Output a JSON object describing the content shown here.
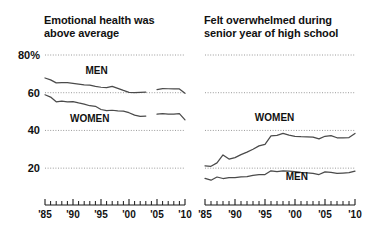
{
  "chart_data": [
    {
      "id": "emotional-health",
      "type": "line",
      "title": "Emotional health was\nabove average",
      "xlabel": "",
      "ylabel": "",
      "ylim": [
        10,
        80
      ],
      "xlim": [
        1985,
        2010
      ],
      "grid": true,
      "grid_values": [
        80,
        60,
        40,
        20
      ],
      "ytick_labels": [
        "80%",
        "60",
        "40",
        "20"
      ],
      "xticks": [
        1985,
        1990,
        1995,
        2000,
        2005,
        2010
      ],
      "xtick_labels": [
        "'85",
        "'90",
        "'95",
        "'00",
        "'05",
        "'10"
      ],
      "legend_position": "inline",
      "series": [
        {
          "name": "MEN",
          "label_x": 1994.2,
          "label_y": 70.0,
          "x": [
            1985,
            1986,
            1987,
            1988,
            1989,
            1990,
            1991,
            1992,
            1993,
            1994,
            1995,
            1996,
            1997,
            1998,
            1999,
            2000,
            2001,
            2002,
            2003,
            2004,
            2005,
            2006,
            2007,
            2008,
            2009,
            2010
          ],
          "values": [
            67.8,
            66.8,
            65.2,
            65.4,
            65.3,
            65.0,
            64.6,
            64.2,
            64.0,
            63.4,
            62.9,
            62.7,
            63.4,
            62.3,
            61.2,
            60.2,
            60.0,
            60.2,
            60.3,
            null,
            61.7,
            62.2,
            62.1,
            62.0,
            62.0,
            59.7
          ]
        },
        {
          "name": "WOMEN",
          "label_x": 1993.0,
          "label_y": 44.5,
          "x": [
            1985,
            1986,
            1987,
            1988,
            1989,
            1990,
            1991,
            1992,
            1993,
            1994,
            1995,
            1996,
            1997,
            1998,
            1999,
            2000,
            2001,
            2002,
            2003,
            2004,
            2005,
            2006,
            2007,
            2008,
            2009,
            2010
          ],
          "values": [
            58.9,
            57.7,
            55.2,
            55.5,
            55.2,
            55.3,
            54.6,
            54.0,
            53.1,
            52.8,
            51.1,
            50.5,
            50.7,
            50.4,
            50.2,
            49.4,
            48.1,
            47.5,
            47.6,
            null,
            48.6,
            48.9,
            48.7,
            48.6,
            48.9,
            45.6
          ]
        }
      ]
    },
    {
      "id": "felt-overwhelmed",
      "type": "line",
      "title": "Felt overwhelmed during\nsenior year of high school",
      "xlabel": "",
      "ylabel": "",
      "ylim": [
        10,
        80
      ],
      "xlim": [
        1985,
        2010
      ],
      "grid": true,
      "grid_values": [
        80,
        60,
        40,
        20
      ],
      "ytick_labels": [
        "",
        "",
        "",
        ""
      ],
      "xticks": [
        1985,
        1990,
        1995,
        2000,
        2005,
        2010
      ],
      "xtick_labels": [
        "'85",
        "'90",
        "'95",
        "'00",
        "'05",
        "'10"
      ],
      "legend_position": "inline",
      "series": [
        {
          "name": "WOMEN",
          "label_x": 1996.6,
          "label_y": 45.0,
          "x": [
            1985,
            1986,
            1987,
            1988,
            1989,
            1990,
            1991,
            1992,
            1993,
            1994,
            1995,
            1996,
            1997,
            1998,
            1999,
            2000,
            2001,
            2002,
            2003,
            2004,
            2005,
            2006,
            2007,
            2008,
            2009,
            2010
          ],
          "values": [
            21.2,
            21.0,
            22.8,
            27.0,
            24.8,
            25.6,
            27.2,
            28.5,
            30.0,
            31.8,
            32.6,
            37.1,
            37.4,
            38.4,
            37.5,
            36.9,
            36.7,
            36.6,
            36.5,
            35.5,
            36.9,
            37.2,
            36.1,
            36.0,
            36.2,
            38.4
          ]
        },
        {
          "name": "MEN",
          "label_x": 2000.3,
          "label_y": 13.6,
          "x": [
            1985,
            1986,
            1987,
            1988,
            1989,
            1990,
            1991,
            1992,
            1993,
            1994,
            1995,
            1996,
            1997,
            1998,
            1999,
            2000,
            2001,
            2002,
            2003,
            2004,
            2005,
            2006,
            2007,
            2008,
            2009,
            2010
          ],
          "values": [
            14.6,
            13.6,
            15.3,
            14.5,
            15.0,
            15.0,
            15.4,
            15.5,
            16.2,
            16.5,
            16.6,
            18.6,
            18.2,
            18.6,
            18.4,
            18.2,
            17.8,
            17.5,
            17.2,
            16.6,
            18.0,
            17.8,
            17.2,
            17.4,
            17.6,
            18.4
          ]
        }
      ]
    }
  ]
}
